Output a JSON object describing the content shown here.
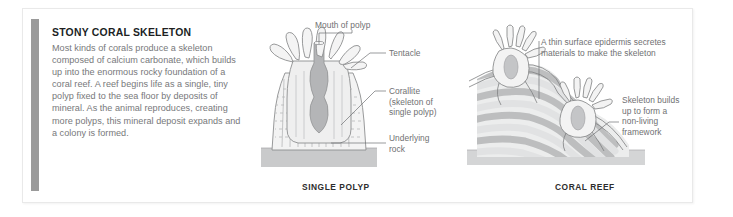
{
  "figure": {
    "name": "stony-coral-skeleton-figure"
  },
  "text_block": {
    "heading": "STONY CORAL SKELETON",
    "paragraph": "Most kinds of corals produce a skeleton composed of calcium carbonate, which builds up into the enormous rocky foundation of a coral reef. A reef begins life as a single, tiny polyp fixed to the sea floor by deposits of mineral. As the animal reproduces, creating more polyps, this mineral deposit expands and a colony is formed."
  },
  "panels": [
    {
      "id": "single-polyp",
      "caption": "SINGLE POLYP",
      "labels": [
        {
          "id": "mouth-of-polyp",
          "text": "Mouth of polyp"
        },
        {
          "id": "tentacle",
          "text": "Tentacle"
        },
        {
          "id": "corallite",
          "text": "Corallite\n(skeleton of\nsingle polyp)"
        },
        {
          "id": "underlying-rock",
          "text": "Underlying\nrock"
        }
      ]
    },
    {
      "id": "coral-reef",
      "caption": "CORAL REEF",
      "labels": [
        {
          "id": "epidermis",
          "text": "A thin surface epidermis secretes\nmaterials to make the skeleton"
        },
        {
          "id": "skeleton-builds",
          "text": "Skeleton builds\nup to form a\nnon-living\nframework"
        }
      ]
    }
  ],
  "colors": {
    "accent_bar": "#9a9a9a",
    "heading_text": "#201f1f",
    "body_text": "#77787a",
    "label_text": "#6f7072",
    "caption_text": "#2d2d2d",
    "frame_border": "#e9e9e9",
    "rock_fill": "#c9cacb",
    "tissue_fill": "#efefef",
    "skeleton_band_dark": "#b9babb",
    "skeleton_band_light": "#e4e5e6",
    "outline": "#8d8e90"
  }
}
